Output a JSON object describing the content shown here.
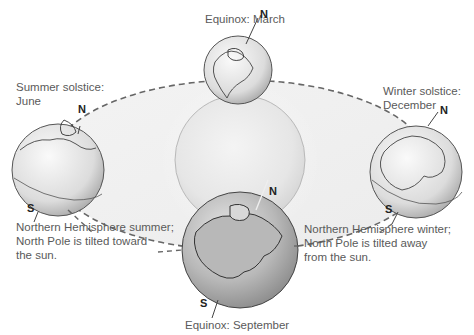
{
  "diagram": {
    "sun": {
      "name": "Sun"
    },
    "orbit": {
      "style": "dashed ellipse"
    },
    "positions": [
      {
        "id": "march",
        "label": "Equinox: March"
      },
      {
        "id": "june",
        "label_line1": "Summer solstice:",
        "label_line2": "June"
      },
      {
        "id": "december",
        "label_line1": "Winter solstice:",
        "label_line2": "December"
      },
      {
        "id": "september",
        "label": "Equinox: September"
      }
    ],
    "pole_labels": {
      "north": "N",
      "south": "S"
    },
    "notes": {
      "summer": [
        "Northern Hemisphere summer;",
        "North Pole is tilted toward",
        "the sun."
      ],
      "winter": [
        "Northern Hemisphere winter;",
        "North Pole is tilted away",
        "from the sun."
      ]
    }
  }
}
